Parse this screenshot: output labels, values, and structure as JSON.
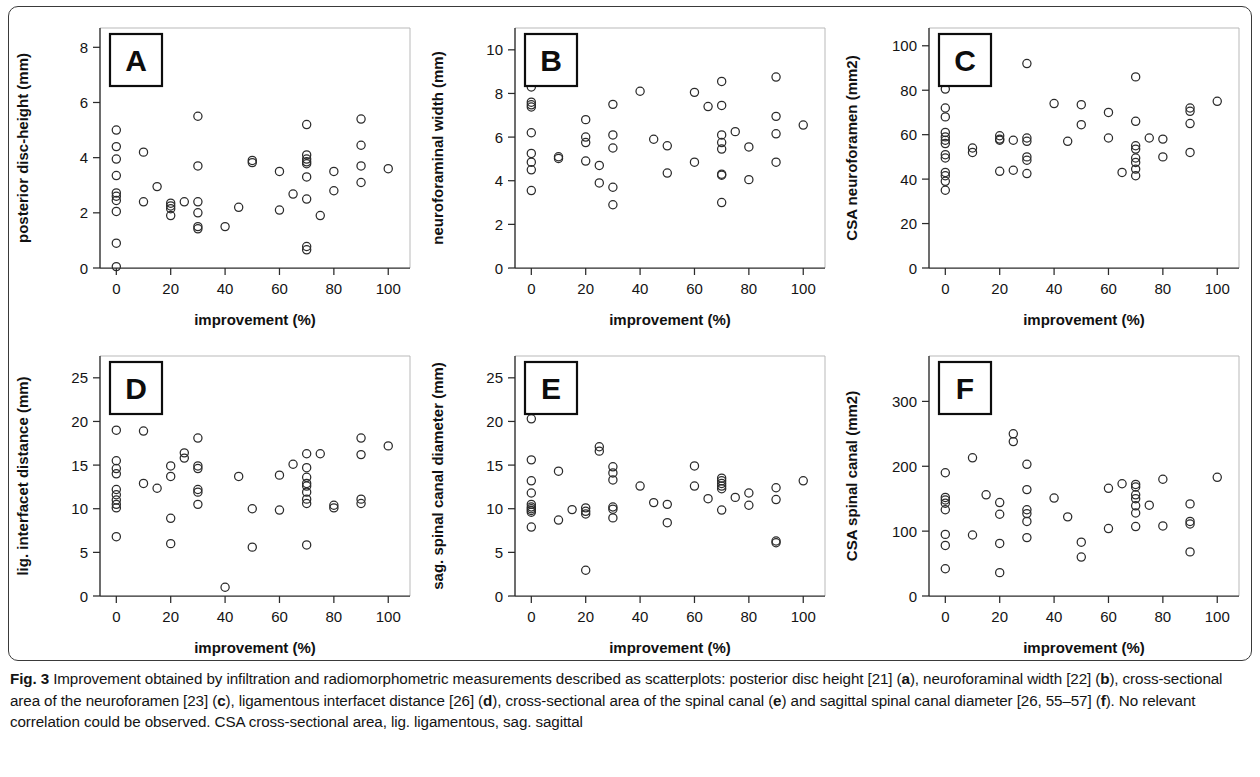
{
  "caption": {
    "figure_number": "Fig. 3",
    "part1": " Improvement obtained by infiltration and radiomorphometric measurements described as scatterplots: posterior disc height [21] (",
    "ref_a": "a",
    "part2": "), neuroforaminal width [22] (",
    "ref_b": "b",
    "part3": "), cross-sectional area of the neuroforamen [23] (",
    "ref_c": "c",
    "part4": "), ligamentous interfacet distance [26] (",
    "ref_d": "d",
    "part5": "), cross-sectional area of the spinal canal (",
    "ref_e": "e",
    "part6": ") and sagittal spinal canal diameter [26, 55–57] (",
    "ref_f": "f",
    "part7": "). No relevant correlation could be observed. CSA cross-sectional area, lig. ligamentous, sag. sagittal"
  },
  "chart_data": [
    {
      "panel": "A",
      "type": "scatter",
      "title": "",
      "xlabel": "improvement (%)",
      "ylabel": "posterior disc-height (mm)",
      "xlim": [
        -6,
        108
      ],
      "ylim": [
        0,
        8.7
      ],
      "xticks": [
        0,
        20,
        40,
        60,
        80,
        100
      ],
      "yticks": [
        0,
        2,
        4,
        6,
        8
      ],
      "grid": false,
      "legend": "none",
      "points": [
        [
          0,
          5.0
        ],
        [
          0,
          4.4
        ],
        [
          0,
          3.95
        ],
        [
          0,
          3.35
        ],
        [
          0,
          2.72
        ],
        [
          0,
          2.6
        ],
        [
          0,
          2.45
        ],
        [
          0,
          2.05
        ],
        [
          0,
          0.9
        ],
        [
          0,
          0.05
        ],
        [
          10,
          4.2
        ],
        [
          10,
          2.4
        ],
        [
          15,
          2.95
        ],
        [
          20,
          2.35
        ],
        [
          20,
          2.25
        ],
        [
          20,
          2.15
        ],
        [
          20,
          1.9
        ],
        [
          25,
          2.4
        ],
        [
          30,
          5.5
        ],
        [
          30,
          3.7
        ],
        [
          30,
          2.4
        ],
        [
          30,
          2.0
        ],
        [
          30,
          1.5
        ],
        [
          30,
          1.42
        ],
        [
          40,
          1.5
        ],
        [
          45,
          2.2
        ],
        [
          50,
          3.9
        ],
        [
          50,
          3.82
        ],
        [
          60,
          3.5
        ],
        [
          60,
          2.1
        ],
        [
          65,
          2.68
        ],
        [
          70,
          5.2
        ],
        [
          70,
          4.1
        ],
        [
          70,
          3.95
        ],
        [
          70,
          3.85
        ],
        [
          70,
          3.78
        ],
        [
          70,
          3.3
        ],
        [
          70,
          2.5
        ],
        [
          70,
          0.78
        ],
        [
          70,
          0.66
        ],
        [
          75,
          1.9
        ],
        [
          80,
          3.5
        ],
        [
          80,
          2.8
        ],
        [
          90,
          5.4
        ],
        [
          90,
          4.45
        ],
        [
          90,
          3.7
        ],
        [
          90,
          3.1
        ],
        [
          100,
          3.6
        ]
      ]
    },
    {
      "panel": "B",
      "type": "scatter",
      "title": "",
      "xlabel": "improvement (%)",
      "ylabel": "neuroforaminal width (mm)",
      "xlim": [
        -6,
        108
      ],
      "ylim": [
        0,
        11
      ],
      "xticks": [
        0,
        20,
        40,
        60,
        80,
        100
      ],
      "yticks": [
        0,
        2,
        4,
        6,
        8,
        10
      ],
      "grid": false,
      "legend": "none",
      "points": [
        [
          0,
          8.3
        ],
        [
          0,
          7.6
        ],
        [
          0,
          7.48
        ],
        [
          0,
          7.38
        ],
        [
          0,
          6.2
        ],
        [
          0,
          5.25
        ],
        [
          0,
          4.85
        ],
        [
          0,
          4.5
        ],
        [
          0,
          3.55
        ],
        [
          10,
          5.1
        ],
        [
          10,
          5.02
        ],
        [
          15,
          8.8
        ],
        [
          20,
          6.8
        ],
        [
          20,
          6.0
        ],
        [
          20,
          5.75
        ],
        [
          20,
          4.9
        ],
        [
          25,
          4.7
        ],
        [
          25,
          3.9
        ],
        [
          30,
          7.5
        ],
        [
          30,
          6.1
        ],
        [
          30,
          5.5
        ],
        [
          30,
          3.7
        ],
        [
          30,
          2.9
        ],
        [
          40,
          8.1
        ],
        [
          45,
          5.9
        ],
        [
          50,
          5.6
        ],
        [
          50,
          4.35
        ],
        [
          60,
          8.05
        ],
        [
          60,
          4.85
        ],
        [
          65,
          7.4
        ],
        [
          70,
          8.55
        ],
        [
          70,
          7.45
        ],
        [
          70,
          6.1
        ],
        [
          70,
          5.75
        ],
        [
          70,
          5.45
        ],
        [
          70,
          4.3
        ],
        [
          70,
          4.25
        ],
        [
          70,
          3.0
        ],
        [
          75,
          6.25
        ],
        [
          80,
          5.55
        ],
        [
          80,
          4.05
        ],
        [
          90,
          8.75
        ],
        [
          90,
          6.95
        ],
        [
          90,
          6.15
        ],
        [
          90,
          4.85
        ],
        [
          100,
          6.55
        ]
      ]
    },
    {
      "panel": "C",
      "type": "scatter",
      "title": "",
      "xlabel": "improvement (%)",
      "ylabel": "CSA neuroforamen (mm2)",
      "xlim": [
        -6,
        108
      ],
      "ylim": [
        0,
        108
      ],
      "xticks": [
        0,
        20,
        40,
        60,
        80,
        100
      ],
      "yticks": [
        0,
        20,
        40,
        60,
        80,
        100
      ],
      "grid": false,
      "legend": "none",
      "points": [
        [
          0,
          80.5
        ],
        [
          0,
          72
        ],
        [
          0,
          68
        ],
        [
          0,
          61
        ],
        [
          0,
          59
        ],
        [
          0,
          57.5
        ],
        [
          0,
          56
        ],
        [
          0,
          51
        ],
        [
          0,
          49.5
        ],
        [
          0,
          43
        ],
        [
          0,
          41.5
        ],
        [
          0,
          39
        ],
        [
          0,
          35
        ],
        [
          10,
          54
        ],
        [
          10,
          52
        ],
        [
          15,
          87
        ],
        [
          20,
          59.5
        ],
        [
          20,
          58
        ],
        [
          20,
          57.5
        ],
        [
          20,
          43.5
        ],
        [
          25,
          57.5
        ],
        [
          25,
          44
        ],
        [
          30,
          92
        ],
        [
          30,
          58.5
        ],
        [
          30,
          57
        ],
        [
          30,
          50
        ],
        [
          30,
          48.5
        ],
        [
          30,
          42.5
        ],
        [
          40,
          74
        ],
        [
          45,
          57
        ],
        [
          50,
          73.5
        ],
        [
          50,
          64.5
        ],
        [
          60,
          70
        ],
        [
          60,
          58.5
        ],
        [
          65,
          43
        ],
        [
          70,
          86
        ],
        [
          70,
          66
        ],
        [
          70,
          55
        ],
        [
          70,
          53.5
        ],
        [
          70,
          49.5
        ],
        [
          70,
          47.5
        ],
        [
          70,
          44.5
        ],
        [
          70,
          41.5
        ],
        [
          75,
          58.5
        ],
        [
          80,
          58
        ],
        [
          80,
          50
        ],
        [
          90,
          72
        ],
        [
          90,
          70.5
        ],
        [
          90,
          65
        ],
        [
          90,
          52
        ],
        [
          100,
          75
        ]
      ]
    },
    {
      "panel": "D",
      "type": "scatter",
      "title": "",
      "xlabel": "improvement (%)",
      "ylabel": "lig. interfacet distance (mm)",
      "xlim": [
        -6,
        108
      ],
      "ylim": [
        0,
        27.5
      ],
      "xticks": [
        0,
        20,
        40,
        60,
        80,
        100
      ],
      "yticks": [
        0,
        5,
        10,
        15,
        20,
        25
      ],
      "grid": false,
      "legend": "none",
      "points": [
        [
          0,
          19.0
        ],
        [
          0,
          15.5
        ],
        [
          0,
          14.6
        ],
        [
          0,
          14.0
        ],
        [
          0,
          12.2
        ],
        [
          0,
          11.6
        ],
        [
          0,
          11.0
        ],
        [
          0,
          10.5
        ],
        [
          0,
          10.1
        ],
        [
          0,
          6.8
        ],
        [
          10,
          18.9
        ],
        [
          10,
          12.9
        ],
        [
          15,
          12.35
        ],
        [
          20,
          14.9
        ],
        [
          20,
          13.7
        ],
        [
          20,
          8.9
        ],
        [
          20,
          6.0
        ],
        [
          25,
          16.4
        ],
        [
          25,
          15.8
        ],
        [
          30,
          18.1
        ],
        [
          30,
          14.9
        ],
        [
          30,
          14.6
        ],
        [
          30,
          12.2
        ],
        [
          30,
          11.9
        ],
        [
          30,
          10.5
        ],
        [
          40,
          1.0
        ],
        [
          45,
          13.7
        ],
        [
          50,
          10.0
        ],
        [
          50,
          5.6
        ],
        [
          60,
          13.85
        ],
        [
          60,
          9.85
        ],
        [
          65,
          15.1
        ],
        [
          70,
          16.3
        ],
        [
          70,
          14.7
        ],
        [
          70,
          13.6
        ],
        [
          70,
          12.9
        ],
        [
          70,
          12.6
        ],
        [
          70,
          11.9
        ],
        [
          70,
          11.1
        ],
        [
          70,
          10.6
        ],
        [
          70,
          5.85
        ],
        [
          75,
          16.3
        ],
        [
          80,
          10.4
        ],
        [
          80,
          10.1
        ],
        [
          90,
          18.1
        ],
        [
          90,
          16.2
        ],
        [
          90,
          11.1
        ],
        [
          90,
          10.6
        ],
        [
          100,
          17.2
        ]
      ]
    },
    {
      "panel": "E",
      "type": "scatter",
      "title": "",
      "xlabel": "improvement (%)",
      "ylabel": "sag. spinal canal diameter (mm)",
      "xlim": [
        -6,
        108
      ],
      "ylim": [
        0,
        27.5
      ],
      "xticks": [
        0,
        20,
        40,
        60,
        80,
        100
      ],
      "yticks": [
        0,
        5,
        10,
        15,
        20,
        25
      ],
      "grid": false,
      "legend": "none",
      "points": [
        [
          0,
          20.3
        ],
        [
          0,
          15.6
        ],
        [
          0,
          13.2
        ],
        [
          0,
          11.8
        ],
        [
          0,
          10.5
        ],
        [
          0,
          10.2
        ],
        [
          0,
          10.0
        ],
        [
          0,
          9.8
        ],
        [
          0,
          9.6
        ],
        [
          0,
          7.9
        ],
        [
          10,
          14.3
        ],
        [
          10,
          8.7
        ],
        [
          15,
          9.9
        ],
        [
          20,
          10.1
        ],
        [
          20,
          9.7
        ],
        [
          20,
          9.4
        ],
        [
          20,
          2.95
        ],
        [
          25,
          17.1
        ],
        [
          25,
          16.6
        ],
        [
          30,
          14.8
        ],
        [
          30,
          14.1
        ],
        [
          30,
          13.3
        ],
        [
          30,
          10.2
        ],
        [
          30,
          9.95
        ],
        [
          30,
          8.95
        ],
        [
          40,
          12.6
        ],
        [
          45,
          10.7
        ],
        [
          50,
          10.5
        ],
        [
          50,
          8.4
        ],
        [
          60,
          14.9
        ],
        [
          60,
          12.6
        ],
        [
          65,
          11.15
        ],
        [
          70,
          13.5
        ],
        [
          70,
          13.2
        ],
        [
          70,
          12.9
        ],
        [
          70,
          12.6
        ],
        [
          70,
          12.3
        ],
        [
          70,
          9.85
        ],
        [
          75,
          11.3
        ],
        [
          80,
          11.8
        ],
        [
          80,
          10.4
        ],
        [
          90,
          12.4
        ],
        [
          90,
          11.05
        ],
        [
          90,
          6.3
        ],
        [
          90,
          6.1
        ],
        [
          100,
          13.2
        ]
      ]
    },
    {
      "panel": "F",
      "type": "scatter",
      "title": "",
      "xlabel": "improvement (%)",
      "ylabel": "CSA spinal canal (mm2)",
      "xlim": [
        -6,
        108
      ],
      "ylim": [
        0,
        370
      ],
      "xticks": [
        0,
        20,
        40,
        60,
        80,
        100
      ],
      "yticks": [
        0,
        100,
        200,
        300
      ],
      "grid": false,
      "legend": "none",
      "points": [
        [
          0,
          190
        ],
        [
          0,
          152
        ],
        [
          0,
          148
        ],
        [
          0,
          143
        ],
        [
          0,
          133
        ],
        [
          0,
          95
        ],
        [
          0,
          78
        ],
        [
          0,
          42
        ],
        [
          10,
          213
        ],
        [
          10,
          94
        ],
        [
          15,
          156
        ],
        [
          20,
          144
        ],
        [
          20,
          126
        ],
        [
          20,
          81
        ],
        [
          20,
          36
        ],
        [
          25,
          250
        ],
        [
          25,
          238
        ],
        [
          30,
          203
        ],
        [
          30,
          164
        ],
        [
          30,
          133
        ],
        [
          30,
          127
        ],
        [
          30,
          115
        ],
        [
          30,
          90
        ],
        [
          40,
          151
        ],
        [
          45,
          122
        ],
        [
          50,
          83
        ],
        [
          50,
          60
        ],
        [
          60,
          166
        ],
        [
          60,
          104
        ],
        [
          65,
          173
        ],
        [
          70,
          172
        ],
        [
          70,
          168
        ],
        [
          70,
          156
        ],
        [
          70,
          150
        ],
        [
          70,
          139
        ],
        [
          70,
          128
        ],
        [
          70,
          107
        ],
        [
          75,
          140
        ],
        [
          80,
          180
        ],
        [
          80,
          108
        ],
        [
          90,
          142
        ],
        [
          90,
          115
        ],
        [
          90,
          111
        ],
        [
          90,
          68
        ],
        [
          100,
          183
        ]
      ]
    }
  ]
}
